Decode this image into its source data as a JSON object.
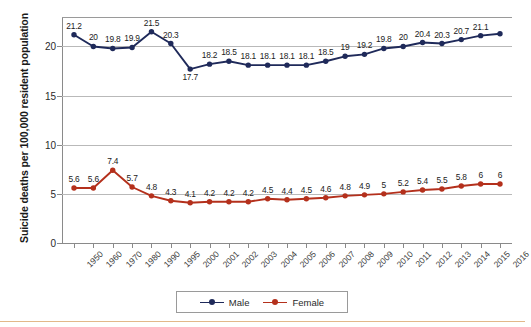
{
  "chart_data": {
    "type": "line",
    "title": "",
    "xlabel": "",
    "ylabel": "Suicide deaths per 100,000 resident population",
    "ylim": [
      0,
      23
    ],
    "yticks": [
      0,
      5,
      10,
      15,
      20
    ],
    "grid": true,
    "legend_position": "bottom-center",
    "categories": [
      "1950",
      "1960",
      "1970",
      "1980",
      "1990",
      "1995",
      "2000",
      "2001",
      "2002",
      "2003",
      "2004",
      "2005",
      "2006",
      "2007",
      "2008",
      "2009",
      "2010",
      "2011",
      "2012",
      "2013",
      "2014",
      "2015",
      "2016"
    ],
    "series": [
      {
        "name": "Male",
        "color": "#1f2a5a",
        "values": [
          21.2,
          20,
          19.8,
          19.9,
          21.5,
          20.3,
          17.7,
          18.2,
          18.5,
          18.1,
          18.1,
          18.1,
          18.1,
          18.5,
          19,
          19.2,
          19.8,
          20,
          20.4,
          20.3,
          20.7,
          21.1,
          21.3
        ],
        "labels": [
          "21.2",
          "20",
          "19.8",
          "19.9",
          "21.5",
          "20.3",
          "17.7",
          "18.2",
          "18.5",
          "18.1",
          "18.1",
          "18.1",
          "18.1",
          "18.5",
          "19",
          "19.2",
          "19.8",
          "20",
          "20.4",
          "20.3",
          "20.7",
          "21.1",
          ""
        ]
      },
      {
        "name": "Female",
        "color": "#b4301c",
        "values": [
          5.6,
          5.6,
          7.4,
          5.7,
          4.8,
          4.3,
          4.1,
          4.2,
          4.2,
          4.2,
          4.5,
          4.4,
          4.5,
          4.6,
          4.8,
          4.9,
          5,
          5.2,
          5.4,
          5.5,
          5.8,
          6,
          6
        ],
        "labels": [
          "5.6",
          "5.6",
          "7.4",
          "5.7",
          "4.8",
          "4.3",
          "4.1",
          "4.2",
          "4.2",
          "4.2",
          "4.5",
          "4.4",
          "4.5",
          "4.6",
          "4.8",
          "4.9",
          "5",
          "5.2",
          "5.4",
          "5.5",
          "5.8",
          "6",
          "6"
        ]
      }
    ]
  },
  "legend": {
    "items": [
      {
        "label": "Male",
        "color": "#1f2a5a"
      },
      {
        "label": "Female",
        "color": "#b4301c"
      }
    ]
  },
  "axis": {
    "y_title": "Suicide deaths per 100,000 resident population"
  }
}
